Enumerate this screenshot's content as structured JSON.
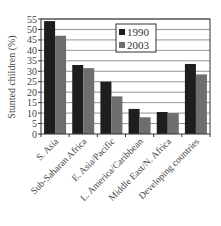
{
  "chart_data": {
    "type": "bar",
    "title": "",
    "xlabel": "",
    "ylabel": "Stunted children (%)",
    "ylim": [
      0,
      55
    ],
    "yticks": [
      0,
      5,
      10,
      15,
      20,
      25,
      30,
      35,
      40,
      45,
      50,
      55
    ],
    "grid": true,
    "legend_position": "upper center",
    "categories": [
      "S. Asia",
      "Sub-Saharan Africa",
      "E. Asia/Pacific",
      "L. America/Caribbean",
      "Middle East/N. Africa",
      "Developing countries"
    ],
    "series": [
      {
        "name": "1990",
        "color": "#1e1e1e",
        "values": [
          54,
          33,
          25,
          12,
          10.5,
          33.5
        ]
      },
      {
        "name": "2003",
        "color": "#6e6e6e",
        "values": [
          47,
          31.5,
          18,
          8,
          10,
          28.5
        ]
      }
    ]
  }
}
